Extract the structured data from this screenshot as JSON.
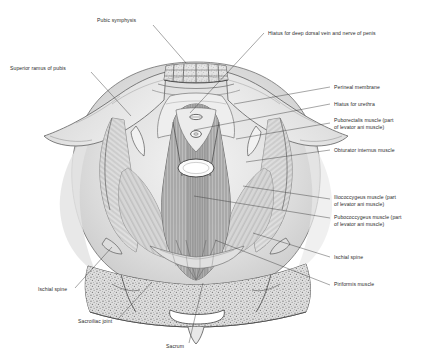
{
  "figure": {
    "background_color": "#ffffff",
    "ink_color": "#2b2b2b",
    "leader_color": "#3a3a3a"
  },
  "labels": [
    {
      "id": "pubic-symphysis",
      "text": "Pubic symphysis",
      "text_x": 97,
      "text_y": 22,
      "anchor": "start",
      "leader": "M 153 25 L 186 63",
      "lines": [
        "Pubic symphysis"
      ]
    },
    {
      "id": "hiatus-deep-dorsal-vein",
      "text": "Hiatus for deep dorsal vein and nerve of penis",
      "text_x": 268,
      "text_y": 35,
      "anchor": "start",
      "leader": "M 264 33 L 190 113",
      "lines": [
        "Hiatus for deep dorsal vein and nerve of penis"
      ]
    },
    {
      "id": "superior-ramus-of-pubis",
      "text": "Superior ramus of pubis",
      "text_x": 10,
      "text_y": 70,
      "anchor": "start",
      "leader": "M 91 72 L 131 116",
      "lines": [
        "Superior ramus of pubis"
      ]
    },
    {
      "id": "perineal-membrane",
      "text": "Perineal membrane",
      "text_x": 334,
      "text_y": 89,
      "anchor": "start",
      "leader": "M 330 87 L 234 104",
      "lines": [
        "Perineal membrane"
      ]
    },
    {
      "id": "hiatus-for-urethra",
      "text": "Hiatus for urethra",
      "text_x": 334,
      "text_y": 106,
      "anchor": "start",
      "leader": "M 330 104 L 194 130",
      "lines": [
        "Hiatus for urethra"
      ]
    },
    {
      "id": "puborectalis-muscle",
      "text": "Puborectalis muscle (part of levator ani muscle)",
      "text_x": 334,
      "text_y": 122,
      "anchor": "start",
      "leader": "M 330 123 L 236 139",
      "lines": [
        "Puborectalis muscle (part",
        "of levator ani muscle)"
      ]
    },
    {
      "id": "obturator-internus-muscle",
      "text": "Obturator internus muscle",
      "text_x": 334,
      "text_y": 152,
      "anchor": "start",
      "leader": "M 330 150 L 246 162",
      "lines": [
        "Obturator internus muscle"
      ]
    },
    {
      "id": "iliococcygeus-muscle",
      "text": "Iliococcygeus muscle (part of levator ani muscle)",
      "text_x": 334,
      "text_y": 199,
      "anchor": "start",
      "leader": "M 330 199 L 243 186",
      "lines": [
        "Iliococcygeus muscle (part",
        "of levator ani muscle)"
      ]
    },
    {
      "id": "pubococcygeus-muscle",
      "text": "Pubococcygeus muscle (part of levator ani muscle)",
      "text_x": 334,
      "text_y": 219,
      "anchor": "start",
      "leader": "M 330 218 L 194 196",
      "lines": [
        "Pubococcygeus muscle (part",
        "of levator ani muscle)"
      ]
    },
    {
      "id": "ischial-spine-right",
      "text": "Ischial spine",
      "text_x": 334,
      "text_y": 259,
      "anchor": "start",
      "leader": "M 330 257 L 253 233",
      "lines": [
        "Ischial spine"
      ]
    },
    {
      "id": "piriformis-muscle",
      "text": "Piriformis muscle",
      "text_x": 334,
      "text_y": 286,
      "anchor": "start",
      "leader": "M 330 285 L 215 240",
      "lines": [
        "Piriformis muscle"
      ]
    },
    {
      "id": "ischial-spine-left",
      "text": "Ischial spine",
      "text_x": 38,
      "text_y": 291,
      "anchor": "start",
      "leader": "M 75 288 L 112 247",
      "lines": [
        "Ischial spine"
      ]
    },
    {
      "id": "sacroiliac-joint",
      "text": "Sacroiliac joint",
      "text_x": 78,
      "text_y": 323,
      "anchor": "start",
      "leader": "M 118 319 L 152 282",
      "lines": [
        "Sacroiliac joint"
      ]
    },
    {
      "id": "sacrum",
      "text": "Sacrum",
      "text_x": 166,
      "text_y": 348,
      "anchor": "start",
      "leader": "M 189 343 L 203 283",
      "lines": [
        "Sacrum"
      ]
    }
  ],
  "structures": {
    "pubic_symphysis": "pubic bone cross-section with cancellous texture",
    "sacrum": "stippled cancellous bone block at inferior border",
    "levator_ani": "striated muscle fibers converging at midline",
    "hiatuses": [
      "deep dorsal vein slit",
      "urethral opening",
      "rectal opening"
    ]
  }
}
